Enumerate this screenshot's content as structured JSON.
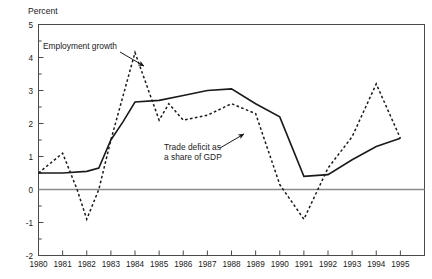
{
  "chart_data": {
    "type": "line",
    "title": "",
    "subtitle": "",
    "unit_label": "Percent",
    "xlabel": "",
    "ylabel": "Percent",
    "xlim": [
      1980,
      1996
    ],
    "ylim": [
      -2,
      5
    ],
    "ytick_step": 1,
    "yminor_step": 0.5,
    "grid": false,
    "zero_line": 0,
    "legend_position": "inline-annotations",
    "x": [
      1980,
      1981,
      1982,
      1983,
      1984,
      1985,
      1986,
      1987,
      1988,
      1989,
      1990,
      1991,
      1992,
      1993,
      1994,
      1995
    ],
    "xtick_labels": [
      "1980",
      "1981",
      "1982",
      "1983",
      "1984",
      "1985",
      "1986",
      "1987",
      "1988",
      "1989",
      "1990",
      "1991",
      "1992",
      "1993",
      "1994",
      "1995"
    ],
    "ytick_labels": [
      "5",
      "4",
      "3",
      "2",
      "1",
      "0",
      "-1",
      "-2"
    ],
    "ytick_values": [
      5,
      4,
      3,
      2,
      1,
      0,
      -1,
      -2
    ],
    "series": [
      {
        "name": "Trade deficit as a share of GDP",
        "style": "solid",
        "color": "#1a1a1a",
        "x": [
          1980,
          1981,
          1982,
          1982.5,
          1983,
          1983.5,
          1984,
          1985,
          1986,
          1987,
          1988,
          1989,
          1990,
          1991,
          1992,
          1993,
          1994,
          1995
        ],
        "values": [
          0.5,
          0.5,
          0.55,
          0.65,
          1.5,
          2.05,
          2.65,
          2.7,
          2.85,
          3.0,
          3.05,
          2.6,
          2.2,
          0.4,
          0.45,
          0.9,
          1.3,
          1.55
        ]
      },
      {
        "name": "Employment growth",
        "style": "dashed",
        "color": "#1a1a1a",
        "x": [
          1980,
          1981,
          1981.6,
          1982,
          1982.5,
          1983,
          1984,
          1985,
          1985.4,
          1986,
          1987,
          1988,
          1989,
          1990,
          1991,
          1992,
          1993,
          1994,
          1995
        ],
        "values": [
          0.5,
          1.1,
          0.0,
          -0.9,
          0.0,
          1.5,
          4.15,
          2.1,
          2.6,
          2.1,
          2.25,
          2.6,
          2.3,
          0.15,
          -0.9,
          0.65,
          1.6,
          3.2,
          1.55
        ]
      }
    ],
    "annotations": [
      {
        "id": "employment-growth-annotation",
        "text_line1": "Employment growth",
        "text_line2": "",
        "text_x": 43,
        "text_y": 49,
        "arrow_from": [
          120,
          52
        ],
        "arrow_to": [
          144,
          66
        ]
      },
      {
        "id": "trade-deficit-annotation",
        "text_line1": "Trade deficit as",
        "text_line2": "a share of GDP",
        "text_x": 164,
        "text_y": 150,
        "arrow_from": [
          220,
          148
        ],
        "arrow_to": [
          244,
          134
        ]
      }
    ]
  }
}
